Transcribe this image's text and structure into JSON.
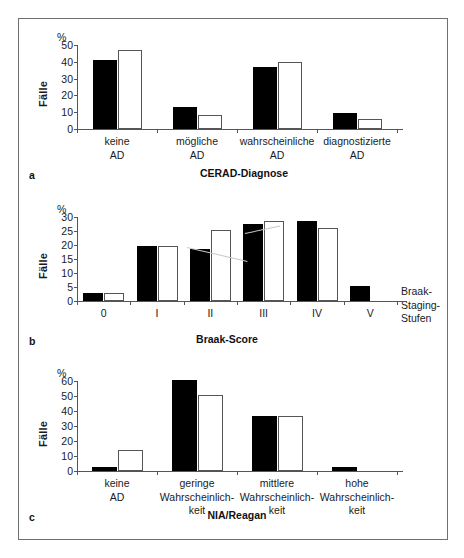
{
  "figure": {
    "panels": [
      {
        "letter": "a",
        "ylabel": "Fälle",
        "unit": "%",
        "xtitle": "CERAD-Diagnose",
        "side_label": "",
        "chart_data": {
          "type": "bar",
          "title": "CERAD-Diagnose",
          "xlabel": "CERAD-Diagnose",
          "ylabel": "Fälle",
          "unit": "%",
          "ylim": [
            0,
            50
          ],
          "yticks": [
            0,
            10,
            20,
            30,
            40,
            50
          ],
          "grid": false,
          "legend": "none",
          "categories": [
            "keine\nAD",
            "mögliche\nAD",
            "wahrscheinliche\nAD",
            "diagnostizierte\nAD"
          ],
          "series": [
            {
              "name": "schwarz",
              "fill": "black",
              "values": [
                41,
                13,
                37,
                9.5
              ]
            },
            {
              "name": "weiß",
              "fill": "white",
              "values": [
                47,
                8.5,
                40,
                6
              ]
            }
          ]
        }
      },
      {
        "letter": "b",
        "ylabel": "Fälle",
        "unit": "%",
        "xtitle": "Braak-Score",
        "side_label": "Braak-\nStaging-\nStufen",
        "chart_data": {
          "type": "bar",
          "title": "Braak-Score",
          "xlabel": "Braak-Score",
          "ylabel": "Fälle",
          "unit": "%",
          "ylim": [
            0,
            30
          ],
          "yticks": [
            0,
            5,
            10,
            15,
            20,
            25,
            30
          ],
          "grid": false,
          "legend": "none",
          "categories": [
            "0",
            "I",
            "II",
            "III",
            "IV",
            "V"
          ],
          "series": [
            {
              "name": "schwarz",
              "fill": "black",
              "values": [
                3,
                19.5,
                18.5,
                27.5,
                28.5,
                5.5
              ]
            },
            {
              "name": "weiß",
              "fill": "white",
              "values": [
                3,
                19.5,
                25.5,
                28.5,
                26,
                0
              ]
            }
          ]
        }
      },
      {
        "letter": "c",
        "ylabel": "Fälle",
        "unit": "%",
        "xtitle": "NIA/Reagan",
        "side_label": "",
        "chart_data": {
          "type": "bar",
          "title": "NIA/Reagan",
          "xlabel": "NIA/Reagan",
          "ylabel": "Fälle",
          "unit": "%",
          "ylim": [
            0,
            60
          ],
          "yticks": [
            0,
            10,
            20,
            30,
            40,
            50,
            60
          ],
          "grid": false,
          "legend": "none",
          "categories": [
            "keine\nAD",
            "geringe\nWahrscheinlich-\nkeit",
            "mittlere\nWahrscheinlich-\nkeit",
            "hohe\nWahrscheinlich-\nkeit"
          ],
          "series": [
            {
              "name": "schwarz",
              "fill": "black",
              "values": [
                2.5,
                61,
                37,
                2.5
              ]
            },
            {
              "name": "weiß",
              "fill": "white",
              "values": [
                14,
                51,
                37,
                0
              ]
            }
          ]
        }
      }
    ],
    "colors": {
      "frame": "#6f6f6f",
      "axis": "#555555",
      "bar_black": "#000000",
      "bar_white": "#ffffff",
      "bar_white_stroke": "#555555",
      "text": "#1a1a1a",
      "background": "#ffffff"
    }
  }
}
